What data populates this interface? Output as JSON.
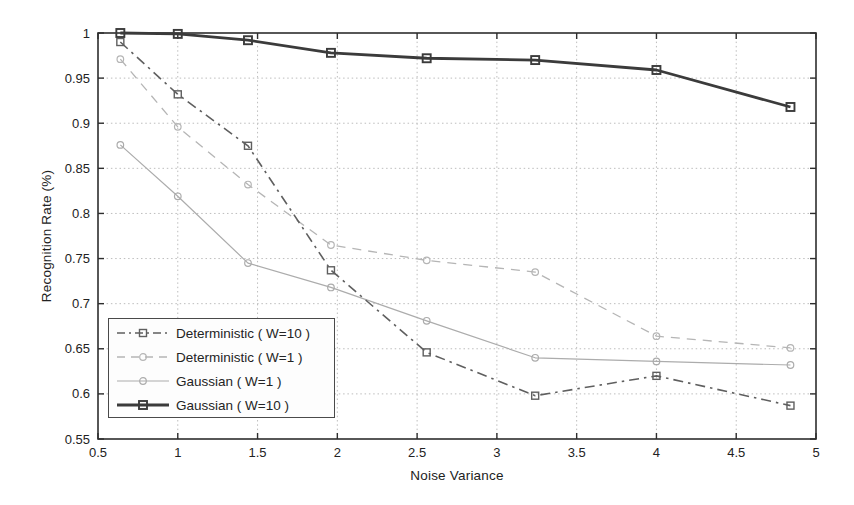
{
  "figure": {
    "background": "#ffffff",
    "axis_color": "#2e2e2e",
    "grid_color": "#bdbdbd",
    "text_color": "#222222"
  },
  "chart_data": {
    "type": "line",
    "title": "",
    "xlabel": "Noise Variance",
    "ylabel": "Recognition Rate (%)",
    "xlim": [
      0.5,
      5
    ],
    "ylim": [
      0.55,
      1
    ],
    "grid": "dotted",
    "legend_position": "lower-left",
    "xticks": [
      0.5,
      1,
      1.5,
      2,
      2.5,
      3,
      3.5,
      4,
      4.5,
      5
    ],
    "xtick_labels": [
      "0.5",
      "1",
      "1.5",
      "2",
      "2.5",
      "3",
      "3.5",
      "4",
      "4.5",
      "5"
    ],
    "yticks": [
      0.55,
      0.6,
      0.65,
      0.7,
      0.75,
      0.8,
      0.85,
      0.9,
      0.95,
      1
    ],
    "ytick_labels": [
      "0.55",
      "0.6",
      "0.65",
      "0.7",
      "0.75",
      "0.8",
      "0.85",
      "0.9",
      "0.95",
      "1"
    ],
    "x": [
      0.64,
      1.0,
      1.44,
      1.96,
      2.56,
      3.24,
      4.0,
      4.84
    ],
    "series": [
      {
        "name": "Deterministic ( W=10 )",
        "slug": "deterministic-w10",
        "marker": "square",
        "line_style": "dash-dot",
        "line_width": 1.6,
        "color": "#5f5f5f",
        "values": [
          0.99,
          0.932,
          0.875,
          0.737,
          0.646,
          0.598,
          0.62,
          0.587
        ]
      },
      {
        "name": "Deterministic ( W=1 )",
        "slug": "deterministic-w1",
        "marker": "circle",
        "line_style": "dashed",
        "line_width": 1.3,
        "color": "#b5b5b5",
        "values": [
          0.971,
          0.896,
          0.832,
          0.765,
          0.748,
          0.735,
          0.664,
          0.651
        ]
      },
      {
        "name": "Gaussian ( W=1 )",
        "slug": "gaussian-w1",
        "marker": "circle",
        "line_style": "solid",
        "line_width": 1.2,
        "color": "#acacac",
        "values": [
          0.876,
          0.819,
          0.745,
          0.718,
          0.681,
          0.64,
          0.636,
          0.632
        ]
      },
      {
        "name": "Gaussian ( W=10 )",
        "slug": "gaussian-w10",
        "marker": "square",
        "line_style": "solid",
        "line_width": 2.8,
        "color": "#3b3b3b",
        "values": [
          1.0,
          0.999,
          0.992,
          0.978,
          0.972,
          0.97,
          0.959,
          0.918
        ]
      }
    ]
  }
}
